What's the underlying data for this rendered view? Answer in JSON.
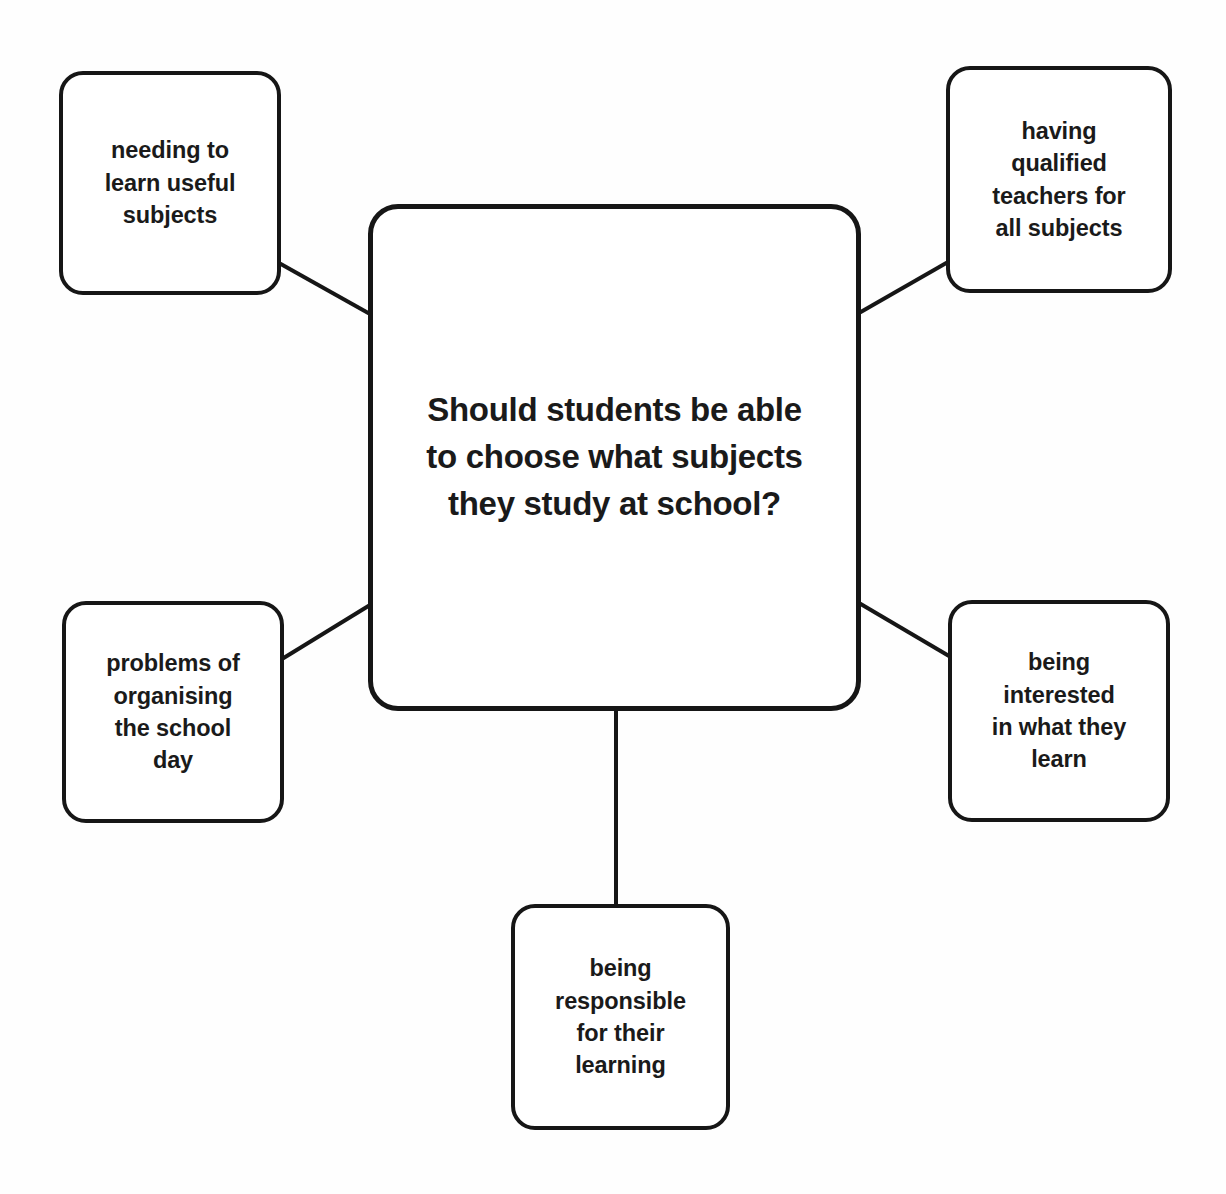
{
  "diagram": {
    "type": "mind-map",
    "title_node": {
      "id": "central",
      "label": "Should students be able\nto choose what subjects\nthey study at school?"
    },
    "branches": [
      {
        "id": "needing-useful-subjects",
        "label": "needing to\nlearn useful\nsubjects",
        "position": "top-left"
      },
      {
        "id": "qualified-teachers",
        "label": "having\nqualified\nteachers for\nall subjects",
        "position": "top-right"
      },
      {
        "id": "organising-school-day",
        "label": "problems of\norganising\nthe school\nday",
        "position": "bottom-left"
      },
      {
        "id": "being-interested",
        "label": "being\ninterested\nin what they\nlearn",
        "position": "bottom-right"
      },
      {
        "id": "being-responsible",
        "label": "being\nresponsible\nfor their\nlearning",
        "position": "bottom-center"
      }
    ],
    "connectors": [
      {
        "from": "needing-useful-subjects",
        "to": "central",
        "x1": 279,
        "y1": 263,
        "x2": 370,
        "y2": 314
      },
      {
        "from": "central",
        "to": "qualified-teachers",
        "x1": 859,
        "y1": 313,
        "x2": 948,
        "y2": 262
      },
      {
        "from": "organising-school-day",
        "to": "central",
        "x1": 282,
        "y1": 659,
        "x2": 370,
        "y2": 605
      },
      {
        "from": "central",
        "to": "being-interested",
        "x1": 859,
        "y1": 603,
        "x2": 949,
        "y2": 656
      },
      {
        "from": "central",
        "to": "being-responsible",
        "x1": 616,
        "y1": 710,
        "x2": 616,
        "y2": 906
      }
    ],
    "style": {
      "background": "#fefefe",
      "stroke": "#161616",
      "text": "#1a1a1a",
      "stroke_width": 4,
      "corner_radius": 24
    }
  }
}
